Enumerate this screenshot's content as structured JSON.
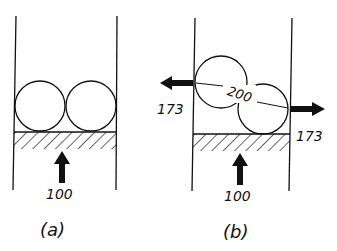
{
  "panels": [
    {
      "id": "a",
      "caption": "(a)",
      "bottom_force": "100"
    },
    {
      "id": "b",
      "caption": "(b)",
      "bottom_force": "100",
      "left_force": "173",
      "right_force": "173",
      "contact_force": "200"
    }
  ],
  "colors": {
    "ink": "#111111",
    "background": "#ffffff"
  }
}
